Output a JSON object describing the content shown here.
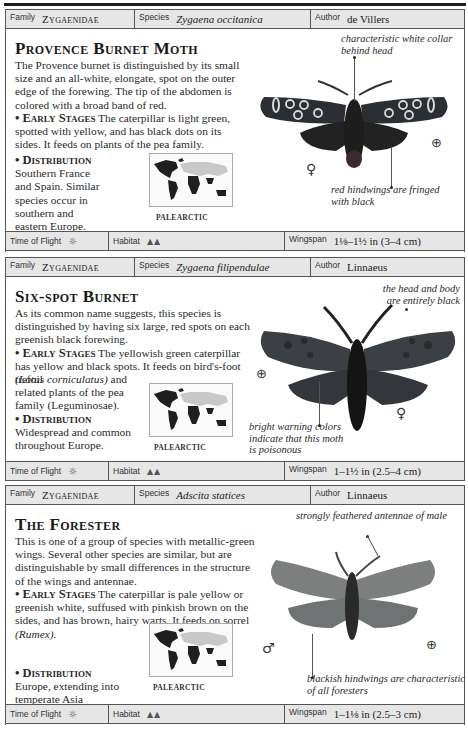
{
  "labels": {
    "family": "Family",
    "species": "Species",
    "author": "Author",
    "time_of_flight": "Time of Flight",
    "habitat": "Habitat",
    "wingspan": "Wingspan",
    "early_stages": "• Early Stages",
    "distribution": "• Distribution"
  },
  "icons": {
    "time_of_flight": "sun-icon",
    "habitat": "meadow-habitat-icon",
    "magnifier": "magnifier-icon",
    "female": "female-symbol-icon",
    "male": "male-symbol-icon"
  },
  "cards": [
    {
      "family": "Zygaenidae",
      "species": "Zygaena occitanica",
      "author": "de Villers",
      "title": "Provence Burnet Moth",
      "intro": "The Provence burnet is distinguished by its small size and an all-white, elongate, spot on the outer edge of the forewing. The tip of the abdomen is colored with a broad band of red.",
      "early_stages": "The caterpillar is light green, spotted with yellow, and has black dots on its sides. It feeds on plants of the pea family.",
      "distribution": "Southern France and Spain. Similar species occur in southern and eastern Europe.",
      "map_label": "PALEARCTIC",
      "annotations": [
        "characteristic white collar behind head",
        "red hindwings are fringed with black"
      ],
      "sex_symbol": "♀",
      "time_of_flight_icon": "☼",
      "habitat_icon": "ᨓᨓ",
      "wingspan": "1⅛–1½ in (3–4 cm)"
    },
    {
      "family": "Zygaenidae",
      "species": "Zygaena filipendulae",
      "author": "Linnaeus",
      "title": "Six-spot Burnet",
      "intro": "As its common name suggests, this species is distinguished by having six large, red spots on each greenish black forewing.",
      "early_stages": "The yellowish green caterpillar has yellow and black spots. It feeds on bird's-foot trefoil",
      "early_stages_latin": "(Lotus corniculatus)",
      "early_stages_rest": "and related plants of the pea family (Leguminosae).",
      "distribution": "Widespread and common throughout Europe.",
      "map_label": "PALEARCTIC",
      "annotations": [
        "the head and body are entirely black",
        "bright warning colors indicate that this moth is poisonous"
      ],
      "sex_symbol": "♀",
      "time_of_flight_icon": "☼",
      "habitat_icon": "ᨓᨓ",
      "wingspan": "1–1½ in (2.5–4 cm)"
    },
    {
      "family": "Zygaenidae",
      "species": "Adscita statices",
      "author": "Linnaeus",
      "title": "The Forester",
      "intro": "This is one of a group of species with metallic-green wings. Several other species are similar, but are distinguishable by small differences in the structure of the wings and antennae.",
      "early_stages": "The caterpillar is pale yellow or greenish white, suffused with pinkish brown on the sides, and has brown, hairy warts. It feeds on sorrel",
      "early_stages_latin": "(Rumex).",
      "distribution": "Europe, extending into temperate Asia",
      "map_label": "PALEARCTIC",
      "annotations": [
        "strongly feathered antennae of male",
        "blackish hindwings are characteristic of all foresters"
      ],
      "sex_symbol": "♂",
      "time_of_flight_icon": "☼",
      "habitat_icon": "ᨓᨓ",
      "wingspan": "1–1⅛ in (2.5–3 cm)"
    }
  ],
  "colors": {
    "header_bg": "#e6e6e6",
    "border": "#555555",
    "map_land_dark": "#1f1f1f",
    "map_land_palearctic": "#c8c8c8",
    "burnet_wing": "#2b2f33",
    "burnet_spot_white": "#d8d8d8",
    "sixspot_wing": "#3c3f44",
    "forester_wing": "#7d7f7f"
  }
}
